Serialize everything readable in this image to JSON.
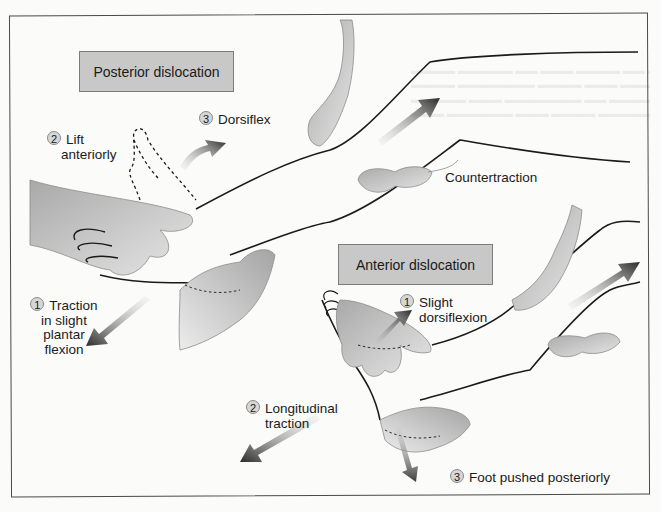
{
  "figure": {
    "panels": [
      {
        "heading": "Posterior dislocation",
        "steps": [
          {
            "number": "1",
            "text": "Traction in slight plantar flexion",
            "lines": [
              "Traction",
              "in slight",
              "plantar",
              "flexion"
            ]
          },
          {
            "number": "2",
            "text": "Lift anteriorly",
            "lines": [
              "Lift",
              "anteriorly"
            ]
          },
          {
            "number": "3",
            "text": "Dorsiflex",
            "lines": [
              "Dorsiflex"
            ]
          }
        ]
      },
      {
        "heading": "Anterior dislocation",
        "steps": [
          {
            "number": "1",
            "text": "Slight dorsiflexion",
            "lines": [
              "Slight",
              "dorsiflexion"
            ]
          },
          {
            "number": "2",
            "text": "Longitudinal traction",
            "lines": [
              "Longitudinal",
              "traction"
            ]
          },
          {
            "number": "3",
            "text": "Foot pushed posteriorly",
            "lines": [
              "Foot pushed posteriorly"
            ]
          }
        ]
      }
    ],
    "shared_label": "Countertraction"
  },
  "colors": {
    "label_box_fill": "#c8c8c8",
    "hand_fill": "#bdbdbd",
    "arrow_dark": "#2e2e2e",
    "outline": "#1a1a1a",
    "frame": "#4a4a4a"
  }
}
